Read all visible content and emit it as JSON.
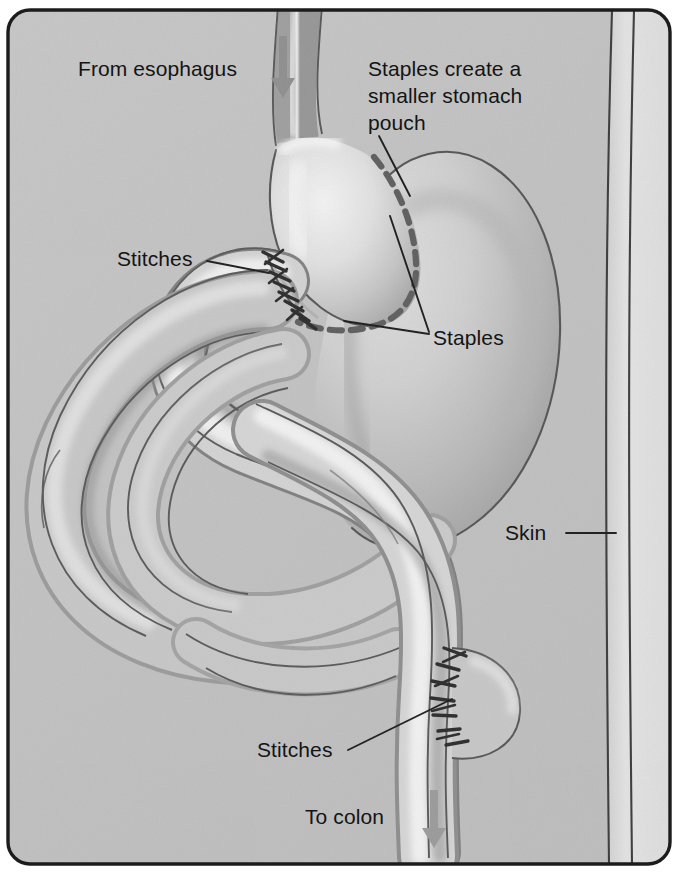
{
  "figure": {
    "frame": {
      "border_color": "#1c1c1c",
      "corner_radius": 22
    },
    "palette": {
      "background": "#c3c3c3",
      "abdomen_wall": "#b8b8b8",
      "skin_band": "#dedede",
      "organ_light": "#e9e9e9",
      "organ_mid": "#c9c9c9",
      "organ_shadow": "#9a9a9a",
      "outline": "#4a4a4a",
      "staple_line": "#5a5a5a",
      "stitch": "#2b2b2b",
      "arrow": "#8f8f8f",
      "text": "#141414"
    }
  },
  "labels": {
    "from_esophagus": "From esophagus",
    "staples_create_pouch": "Staples create a\nsmaller stomach\npouch",
    "stitches_top": "Stitches",
    "staples": "Staples",
    "skin": "Skin",
    "stitches_bottom": "Stitches",
    "to_colon": "To colon"
  },
  "annotations": {
    "arrows": [
      {
        "name": "esophagus-flow-arrow",
        "direction": "down",
        "x": 283,
        "y_from": 36,
        "y_to": 96
      },
      {
        "name": "colon-flow-arrow",
        "direction": "down",
        "x": 434,
        "y_from": 790,
        "y_to": 846
      }
    ],
    "leader_lines": [
      {
        "name": "staples-pouch-leader",
        "from": [
          379,
          136
        ],
        "to": [
          410,
          196
        ]
      },
      {
        "name": "stitches-top-leader",
        "from": [
          207,
          261
        ],
        "to": [
          269,
          273
        ]
      },
      {
        "name": "staples-leader-upper",
        "from": [
          429,
          332
        ],
        "to": [
          390,
          216
        ]
      },
      {
        "name": "staples-leader-lower",
        "from": [
          429,
          334
        ],
        "to": [
          344,
          321
        ]
      },
      {
        "name": "skin-leader",
        "from": [
          566,
          533
        ],
        "to": [
          616,
          533
        ]
      },
      {
        "name": "stitches-bottom-leader",
        "from": [
          348,
          750
        ],
        "to": [
          452,
          699
        ]
      }
    ]
  },
  "anatomy": [
    {
      "name": "esophagus",
      "description": "Tube entering from top of frame"
    },
    {
      "name": "stomach-pouch",
      "description": "Small upper pouch created by staples"
    },
    {
      "name": "remnant-stomach",
      "description": "Large bypassed stomach remnant at right"
    },
    {
      "name": "staple-line",
      "description": "Dashed line separating pouch from remnant"
    },
    {
      "name": "roux-limb",
      "description": "Jejunum limb anastomosed to the pouch"
    },
    {
      "name": "small-intestine-loops",
      "description": "Coiled small bowel filling the center"
    },
    {
      "name": "jejunojejunostomy",
      "description": "Lower stitched anastomosis"
    },
    {
      "name": "skin",
      "description": "Abdominal wall / skin band at right edge"
    }
  ]
}
